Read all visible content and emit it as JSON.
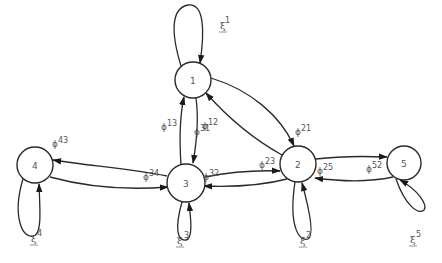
{
  "diagram": {
    "type": "state-transition-graph",
    "nodes": [
      {
        "id": "1",
        "label": "1",
        "x": 193,
        "y": 80,
        "r": 18
      },
      {
        "id": "2",
        "label": "2",
        "x": 298,
        "y": 164,
        "r": 18
      },
      {
        "id": "3",
        "label": "3",
        "x": 186,
        "y": 183,
        "r": 19
      },
      {
        "id": "4",
        "label": "4",
        "x": 35,
        "y": 165,
        "r": 18
      },
      {
        "id": "5",
        "label": "5",
        "x": 404,
        "y": 163,
        "r": 17
      }
    ],
    "self_loops": [
      {
        "node": "1",
        "label": "ξ",
        "sup": "1"
      },
      {
        "node": "2",
        "label": "ξ",
        "sup": "2"
      },
      {
        "node": "3",
        "label": "ξ",
        "sup": "3"
      },
      {
        "node": "4",
        "label": "ξ",
        "sup": "4"
      },
      {
        "node": "5",
        "label": "ξ",
        "sup": "5"
      }
    ],
    "edges": [
      {
        "from": "1",
        "to": "3",
        "label": "ϕ",
        "sup": "13"
      },
      {
        "from": "3",
        "to": "1",
        "label": "ϕ",
        "sup": "31"
      },
      {
        "from": "1",
        "to": "2",
        "label": "ϕ",
        "sup": "12"
      },
      {
        "from": "2",
        "to": "1",
        "label": "ϕ",
        "sup": "21"
      },
      {
        "from": "3",
        "to": "4",
        "label": "ϕ",
        "sup": "43"
      },
      {
        "from": "4",
        "to": "3",
        "label": "ϕ",
        "sup": "34"
      },
      {
        "from": "3",
        "to": "2",
        "label": "ϕ",
        "sup": "23"
      },
      {
        "from": "2",
        "to": "3",
        "label": "ϕ",
        "sup": "32"
      },
      {
        "from": "2",
        "to": "5",
        "label": "ϕ",
        "sup": "25"
      },
      {
        "from": "5",
        "to": "2",
        "label": "ϕ",
        "sup": "52"
      }
    ]
  },
  "labels": {
    "n1": "1",
    "n2": "2",
    "n3": "3",
    "n4": "4",
    "n5": "5",
    "phi": "ϕ",
    "xi": "ξ",
    "e13": "13",
    "e12": "12",
    "e31": "31",
    "e21": "21",
    "e43": "43",
    "e34": "34",
    "e23": "23",
    "e32": "32",
    "e25": "25",
    "e52": "52",
    "x1": "1",
    "x2": "2",
    "x3": "3",
    "x4": "4",
    "x5": "5"
  }
}
